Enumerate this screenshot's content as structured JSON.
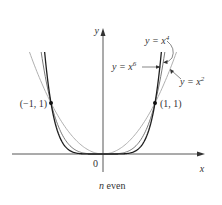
{
  "chart_data": {
    "type": "line",
    "title": "",
    "caption": "n even",
    "xlabel": "x",
    "ylabel": "y",
    "origin_label": "0",
    "xlim": [
      -1.75,
      1.95
    ],
    "ylim": [
      -0.35,
      2.45
    ],
    "grid": false,
    "series": [
      {
        "name": "y = x^2",
        "label": "y = x",
        "exp": "2",
        "power": 2,
        "color": "#b0b0b0",
        "x": [
          -1.4,
          -1,
          -0.5,
          0,
          0.5,
          1,
          1.4
        ],
        "y": [
          1.96,
          1,
          0.25,
          0,
          0.25,
          1,
          1.96
        ]
      },
      {
        "name": "y = x^4",
        "label": "y = x",
        "exp": "4",
        "power": 4,
        "color": "#7a7a7a",
        "x": [
          -1.2,
          -1,
          -0.5,
          0,
          0.5,
          1,
          1.2
        ],
        "y": [
          2.07,
          1,
          0.0625,
          0,
          0.0625,
          1,
          2.07
        ]
      },
      {
        "name": "y = x^6",
        "label": "y = x",
        "exp": "6",
        "power": 6,
        "color": "#222222",
        "x": [
          -1.13,
          -1,
          -0.5,
          0,
          0.5,
          1,
          1.13
        ],
        "y": [
          2.08,
          1,
          0.0156,
          0,
          0.0156,
          1,
          2.08
        ]
      }
    ],
    "points": [
      {
        "label": "(−1, 1)",
        "x": -1,
        "y": 1
      },
      {
        "label": "(1, 1)",
        "x": 1,
        "y": 1
      }
    ]
  },
  "labels": {
    "x_axis": "x",
    "y_axis": "y",
    "origin": "0",
    "caption": "n",
    "caption_rest": " even",
    "point_left": "(−1, 1)",
    "point_right": "(1, 1)",
    "x2_base": "y = x",
    "x2_exp": "2",
    "x4_base": "y = x",
    "x4_exp": "4",
    "x6_base": "y = x",
    "x6_exp": "6"
  }
}
